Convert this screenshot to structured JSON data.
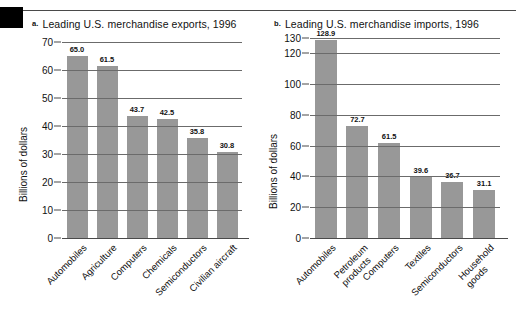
{
  "figure": {
    "top_rule": true,
    "marker_box_color": "#000000",
    "bar_color": "#989898",
    "axis_color": "#4a4a4a",
    "grid_color": "#6b6b6b"
  },
  "chart_data": [
    {
      "type": "bar",
      "panel_letter": "a.",
      "title": "Leading U.S. merchandise exports, 1996",
      "ylabel": "Billions of dollars",
      "xlabel": "",
      "categories": [
        "Automobiles",
        "Agriculture",
        "Computers",
        "Chemicals",
        "Semiconductors",
        "Civilian aircraft"
      ],
      "values": [
        65.0,
        61.5,
        43.7,
        42.5,
        35.8,
        30.8
      ],
      "value_labels": [
        "65.0",
        "61.5",
        "43.7",
        "42.5",
        "35.8",
        "30.8"
      ],
      "ticks": [
        70,
        60,
        50,
        40,
        30,
        20,
        10,
        0
      ],
      "tick_labels": [
        "70",
        "60",
        "50",
        "40",
        "30",
        "20",
        "10",
        "0"
      ],
      "ylim": [
        0,
        70
      ],
      "grid": true,
      "legend": "none"
    },
    {
      "type": "bar",
      "panel_letter": "b.",
      "title": "Leading U.S. merchandise imports, 1996",
      "ylabel": "Billions of dollars",
      "xlabel": "",
      "categories": [
        "Automobiles",
        "Petroleum products",
        "Computers",
        "Textiles",
        "Semiconductors",
        "Household goods"
      ],
      "category_lines": [
        [
          "Automobiles"
        ],
        [
          "Petroleum",
          "products"
        ],
        [
          "Computers"
        ],
        [
          "Textiles"
        ],
        [
          "Semiconductors"
        ],
        [
          "Household",
          "goods"
        ]
      ],
      "values": [
        128.9,
        72.7,
        61.5,
        39.6,
        36.7,
        31.1
      ],
      "value_labels": [
        "128.9",
        "72.7",
        "61.5",
        "39.6",
        "36.7",
        "31.1"
      ],
      "ticks": [
        130,
        120,
        100,
        80,
        60,
        40,
        20,
        0
      ],
      "tick_labels": [
        "130",
        "120",
        "100",
        "80",
        "60",
        "40",
        "20",
        "0"
      ],
      "ylim": [
        0,
        130
      ],
      "grid": true,
      "legend": "none"
    }
  ]
}
